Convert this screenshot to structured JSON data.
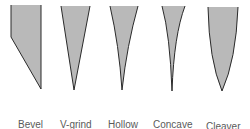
{
  "diagram": {
    "fill_color": "#b9b9b9",
    "stroke_color": "#2a2a2a",
    "grinds": [
      {
        "name": "bevel",
        "line1": "Bevel",
        "line2": "grind",
        "label_x": 18,
        "label_y": 97
      },
      {
        "name": "v-grind",
        "line1": "V-grind",
        "line2": "",
        "label_x": 60,
        "label_y": 97
      },
      {
        "name": "hollow",
        "line1": "Hollow",
        "line2": "grind",
        "label_x": 108,
        "label_y": 97
      },
      {
        "name": "concave",
        "line1": "Concave",
        "line2": "grind",
        "label_x": 153,
        "label_y": 97
      },
      {
        "name": "cleaver",
        "line1": "Cleaver",
        "line2": "grind",
        "label_x": 206,
        "label_y": 99
      }
    ]
  }
}
